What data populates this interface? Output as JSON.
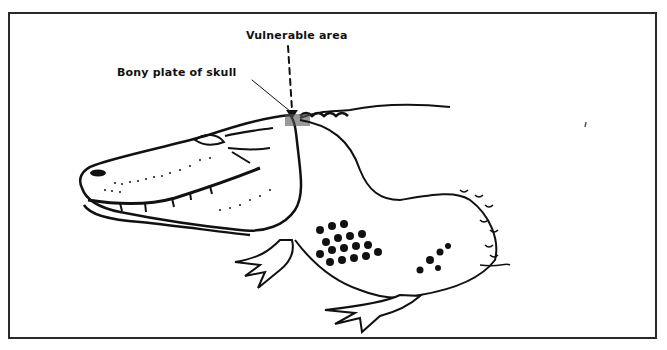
{
  "figure": {
    "labels": {
      "vulnerable_area": "Vulnerable area",
      "bony_plate": "Bony plate of skull"
    },
    "colors": {
      "ink": "#111111",
      "background": "#ffffff",
      "frame": "#2a2a2a"
    }
  }
}
